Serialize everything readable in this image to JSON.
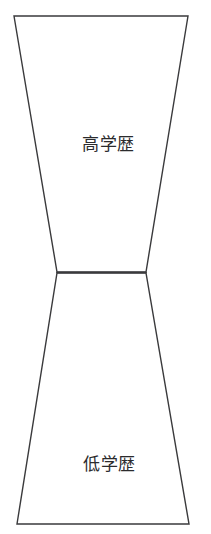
{
  "diagram": {
    "type": "hourglass-two-trapezoids",
    "background_color": "#ffffff",
    "stroke_color": "#3a3a3c",
    "fill_color": "#ffffff",
    "segments": [
      {
        "id": "upper",
        "label": "高学歴",
        "position": "top",
        "shape": "trapezoid-narrowing-downward",
        "top_width_px": 174,
        "bottom_width_px": 89
      },
      {
        "id": "lower",
        "label": "低学歴",
        "position": "bottom",
        "shape": "trapezoid-widening-downward",
        "top_width_px": 89,
        "bottom_width_px": 172
      }
    ],
    "geometry": {
      "upper_polygon": "14,16 188,16 146,272 57,272",
      "lower_polygon": "57,273 146,273 189,524 17,524",
      "waist_line": "57,272.5 146,272.5"
    }
  }
}
